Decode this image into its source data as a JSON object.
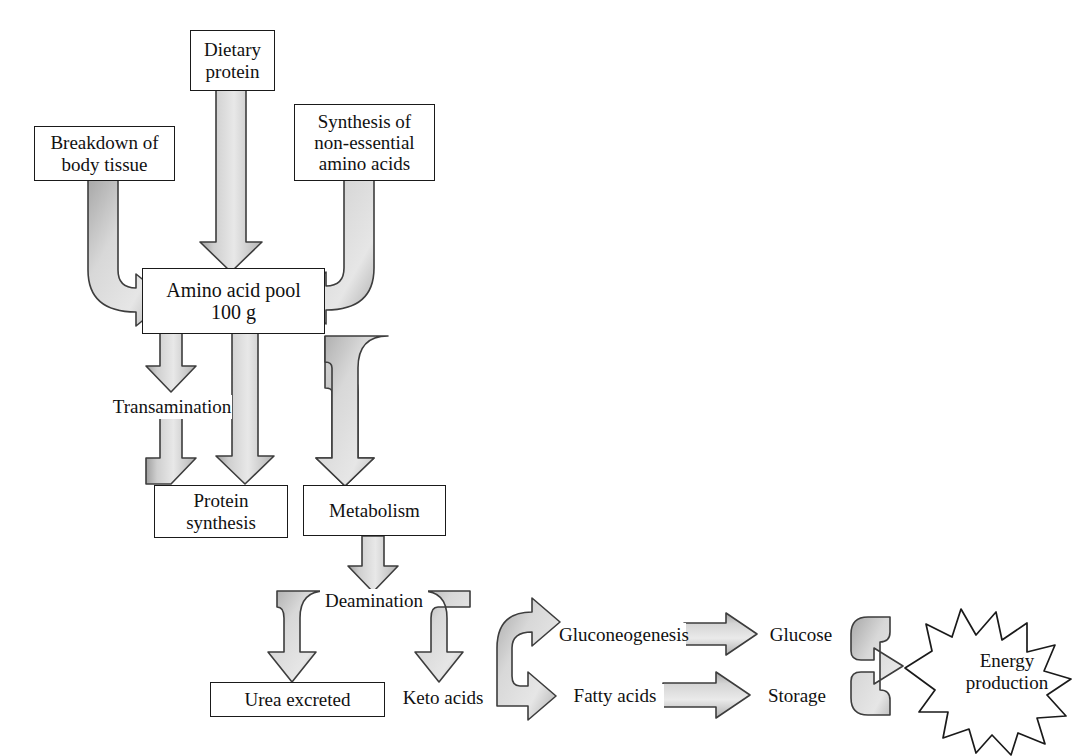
{
  "diagram": {
    "style": {
      "arrow_fill_light": "#e2e2e2",
      "arrow_fill_dark": "#a9a9a9",
      "arrow_stroke": "#3d3d3d",
      "box_stroke": "#1a1a1a",
      "text_color": "#111111",
      "background": "#ffffff"
    },
    "nodes": {
      "dietary_protein": "Dietary\nprotein",
      "breakdown_body_tissue": "Breakdown of\nbody tissue",
      "synthesis_non_essential": "Synthesis of\nnon-essential\namino acids",
      "amino_acid_pool": "Amino acid pool\n100 g",
      "transamination": "Transamination",
      "protein_synthesis": "Protein\nsynthesis",
      "metabolism": "Metabolism",
      "deamination": "Deamination",
      "urea_excreted": "Urea excreted",
      "keto_acids": "Keto acids",
      "gluconeogenesis": "Gluconeogenesis",
      "fatty_acids": "Fatty acids",
      "glucose": "Glucose",
      "storage": "Storage",
      "energy_production": "Energy\nproduction"
    },
    "nodes_flat": {
      "dietary_protein_line1": "Dietary",
      "dietary_protein_line2": "protein",
      "breakdown_line1": "Breakdown of",
      "breakdown_line2": "body tissue",
      "synthesis_line1": "Synthesis of",
      "synthesis_line2": "non-essential",
      "synthesis_line3": "amino acids",
      "pool_line1": "Amino acid pool",
      "pool_line2": "100 g",
      "transamination": "Transamination",
      "protein_synthesis_line1": "Protein",
      "protein_synthesis_line2": "synthesis",
      "metabolism": "Metabolism",
      "deamination": "Deamination",
      "urea_excreted": "Urea excreted",
      "keto_acids": "Keto acids",
      "gluconeogenesis": "Gluconeogenesis",
      "fatty_acids": "Fatty acids",
      "glucose": "Glucose",
      "storage": "Storage",
      "energy_line1": "Energy",
      "energy_line2": "production"
    },
    "edges": [
      {
        "from": "dietary_protein",
        "to": "amino_acid_pool",
        "shape": "straight-down"
      },
      {
        "from": "breakdown_body_tissue",
        "to": "amino_acid_pool",
        "shape": "elbow-down-right"
      },
      {
        "from": "synthesis_non_essential",
        "to": "amino_acid_pool",
        "shape": "elbow-down-left"
      },
      {
        "from": "amino_acid_pool",
        "to": "transamination",
        "shape": "straight-down"
      },
      {
        "from": "transamination",
        "to": "protein_synthesis",
        "shape": "straight-down"
      },
      {
        "from": "amino_acid_pool",
        "to": "protein_synthesis",
        "shape": "straight-down"
      },
      {
        "from": "amino_acid_pool",
        "to": "metabolism",
        "shape": "elbow-right-down"
      },
      {
        "from": "metabolism",
        "to": "deamination",
        "shape": "straight-down"
      },
      {
        "from": "deamination",
        "to": "urea_excreted",
        "shape": "elbow-left-down"
      },
      {
        "from": "deamination",
        "to": "keto_acids",
        "shape": "elbow-right-down"
      },
      {
        "from": "keto_acids",
        "to": "gluconeogenesis",
        "shape": "split-right-up"
      },
      {
        "from": "keto_acids",
        "to": "fatty_acids",
        "shape": "split-right-down"
      },
      {
        "from": "gluconeogenesis",
        "to": "glucose",
        "shape": "straight-right"
      },
      {
        "from": "fatty_acids",
        "to": "storage",
        "shape": "straight-right"
      },
      {
        "from": "glucose",
        "to": "energy_production",
        "shape": "merge-right"
      },
      {
        "from": "storage",
        "to": "energy_production",
        "shape": "merge-right"
      }
    ]
  }
}
